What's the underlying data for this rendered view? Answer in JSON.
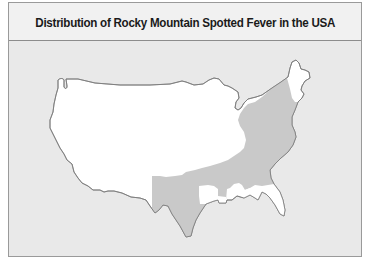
{
  "figure": {
    "title": "Distribution of Rocky Mountain Spotted Fever in the USA"
  },
  "map": {
    "region": "Contiguous United States",
    "layers": [
      {
        "name": "USA landmass (no reported distribution)",
        "fill": "#ffffff"
      },
      {
        "name": "Rocky Mountain Spotted Fever distribution area",
        "fill": "#c9c9c9"
      }
    ],
    "shaded_region_description": "Eastern and southeastern states from Texas/Oklahoma east to the Atlantic coast, north through New England (excluding northern Maine, Florida peninsula and Louisiana area)"
  },
  "colors": {
    "background": "#e9e9e9",
    "title_band": "#f1f1f1",
    "land": "#ffffff",
    "distribution": "#c9c9c9",
    "outline": "#7a7a7a",
    "frame_border": "#9a9a9a"
  }
}
